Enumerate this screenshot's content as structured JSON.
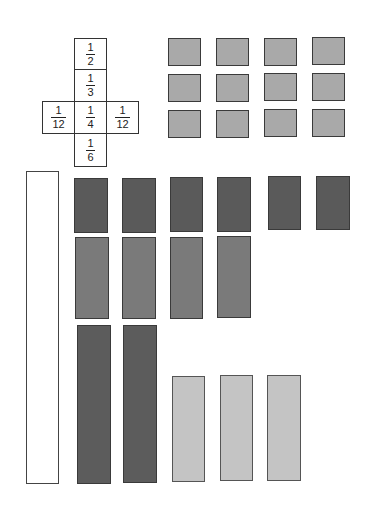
{
  "fraction_net": {
    "cells": [
      {
        "id": "top",
        "num": "1",
        "den": "2"
      },
      {
        "id": "upper",
        "num": "1",
        "den": "3"
      },
      {
        "id": "left",
        "num": "1",
        "den": "12"
      },
      {
        "id": "center",
        "num": "1",
        "den": "4"
      },
      {
        "id": "right",
        "num": "1",
        "den": "12"
      },
      {
        "id": "bottom",
        "num": "1",
        "den": "6"
      }
    ]
  },
  "tile_groups": {
    "grid_tiles": {
      "rows": 3,
      "cols": 4,
      "color": "#a9a9a9"
    },
    "row1_dark_tiles": {
      "count": 6,
      "color": "#5a5a5a"
    },
    "row2_medium_tiles": {
      "count": 4,
      "color": "#7a7a7a"
    },
    "row3_tall_dark_tiles": {
      "count": 2,
      "color": "#5c5c5c"
    },
    "row3_light_tiles": {
      "count": 3,
      "color": "#c4c4c4"
    },
    "whole_bar": {
      "count": 1,
      "color": "#ffffff"
    }
  }
}
